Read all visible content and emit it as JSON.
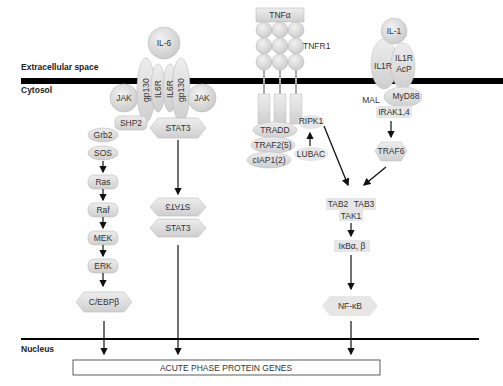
{
  "regions": {
    "extracellular": "Extracellular space",
    "cytosol": "Cytosol",
    "nucleus": "Nucleus"
  },
  "il6": {
    "ligand": "IL-6",
    "receptors": [
      "gp130",
      "IL6R",
      "IL6R",
      "gp130"
    ],
    "jak_left": "JAK",
    "jak_right": "JAK",
    "shp2": "SHP2",
    "stat3": "STAT3",
    "mapk_chain": [
      "Grb2",
      "SOS",
      "Ras",
      "Raf",
      "MEK",
      "ERK"
    ],
    "cebpb": "C/EBPβ",
    "stat3_dimer_top": "STAT3",
    "stat3_dimer_bottom": "STAT3"
  },
  "tnf": {
    "ligand": "TNFα",
    "receptor": "TNFR1",
    "tradd": "TRADD",
    "traf2": "TRAF2(5)",
    "ciap1": "cIAP1(2)",
    "ripk1": "RIPK1",
    "lubac": "LUBAC"
  },
  "il1": {
    "ligand": "IL-1",
    "receptor": "IL1R",
    "acp_line1": "IL1R",
    "acp_line2": "AcP",
    "mal": "MAL",
    "myd88": "MyD88",
    "irak": "IRAK1,4",
    "traf6": "TRAF6"
  },
  "convergence": {
    "tab2": "TAB2",
    "tab3": "TAB3",
    "tak1": "TAK1",
    "ikb": "IκBα, β",
    "nfkb": "NF-κB"
  },
  "genes_box": "ACUTE PHASE PROTEIN GENES",
  "colors": {
    "membrane": "#000000",
    "protein_fill": "#dcdcdc",
    "protein_stroke": "#b8b8b8",
    "arrow": "#111111"
  }
}
